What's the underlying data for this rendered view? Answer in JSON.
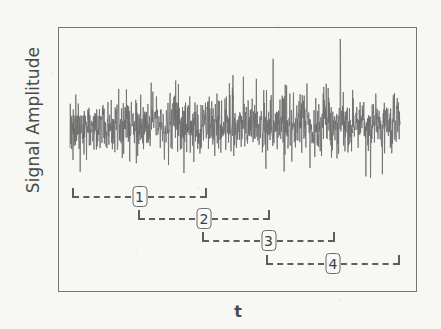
{
  "figure": {
    "background_color": "#f7f7f4",
    "trace_color": "#6b6b6b",
    "frame_color": "#767674",
    "label_color": "#4a4a48"
  },
  "axes": {
    "y_label": "Signal Amplitude",
    "x_label": "t",
    "frame": {
      "left": 58,
      "top": 27,
      "width": 359,
      "height": 265
    }
  },
  "chart_data": {
    "type": "line",
    "title": "",
    "xlabel": "t",
    "ylabel": "Signal Amplitude",
    "grid": false,
    "legend": "none",
    "xlim": [
      0,
      1
    ],
    "ylim": [
      -1,
      1
    ],
    "xtick_labels": [],
    "ytick_labels": [],
    "series": [
      {
        "name": "noisy-signal",
        "description": "Dense broadband random noise trace spanning the full plot width, zero-mean, with dense core amplitude band and sparse large positive and negative spikes.",
        "color": "#6b6b6b",
        "x_range_px": [
          70,
          400
        ],
        "dense_band_px": [
          100,
          150
        ],
        "spike_extent_px": [
          38,
          195
        ],
        "n_points": 1200,
        "rms_amplitude": 0.18,
        "max_amplitude": 0.92,
        "min_amplitude": -0.88
      }
    ],
    "annotations": [
      {
        "kind": "window-bracket",
        "label": "1",
        "x_start_px": 72,
        "x_end_px": 207,
        "y_px": 197
      },
      {
        "kind": "window-bracket",
        "label": "2",
        "x_start_px": 138,
        "x_end_px": 270,
        "y_px": 219
      },
      {
        "kind": "window-bracket",
        "label": "3",
        "x_start_px": 202,
        "x_end_px": 335,
        "y_px": 241
      },
      {
        "kind": "window-bracket",
        "label": "4",
        "x_start_px": 266,
        "x_end_px": 400,
        "y_px": 264
      }
    ]
  }
}
